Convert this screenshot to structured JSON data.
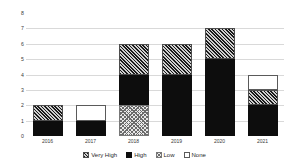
{
  "chart_data": {
    "type": "bar",
    "stacked": true,
    "title": "",
    "xlabel": "",
    "ylabel": "",
    "ylim": [
      0,
      8
    ],
    "yticks": [
      0,
      1,
      2,
      3,
      4,
      5,
      6,
      7,
      8
    ],
    "grid": true,
    "legend_position": "bottom",
    "categories": [
      "2016",
      "2017",
      "2018",
      "2019",
      "2020",
      "2021"
    ],
    "series": [
      {
        "name": "Very High",
        "values": [
          1,
          0,
          2,
          2,
          2,
          1
        ]
      },
      {
        "name": "High",
        "values": [
          1,
          1,
          2,
          4,
          5,
          2
        ]
      },
      {
        "name": "Low",
        "values": [
          0,
          0,
          2,
          0,
          0,
          0
        ]
      },
      {
        "name": "None",
        "values": [
          0,
          1,
          0,
          0,
          0,
          1
        ]
      }
    ],
    "stack_order_bottom_to_top": [
      "Low",
      "High",
      "Very High",
      "None"
    ],
    "totals": [
      2,
      2,
      6,
      6,
      7,
      4
    ]
  },
  "legend": {
    "items": [
      {
        "label": "Very High",
        "pattern": "diagonal-hatch"
      },
      {
        "label": "High",
        "pattern": "solid-black"
      },
      {
        "label": "Low",
        "pattern": "checker-hatch"
      },
      {
        "label": "None",
        "pattern": "white-outline"
      }
    ]
  },
  "colors": {
    "high": "#0d0d0d",
    "very_high": "#4d4d4d",
    "low": "#9a9a9a",
    "none": "#ffffff",
    "gridline": "#d9d9d9",
    "axis_text": "#3a3a3a",
    "background": "#ffffff"
  }
}
